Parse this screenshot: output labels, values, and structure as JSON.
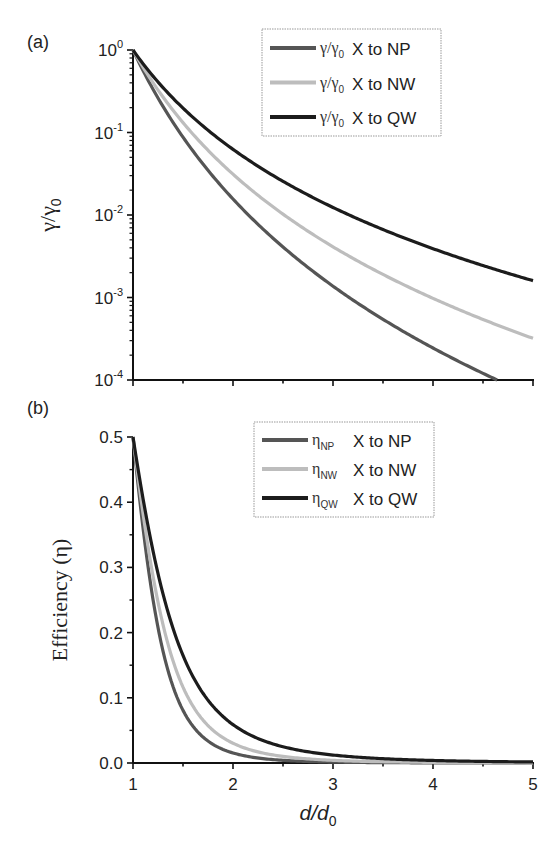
{
  "chart_data": [
    {
      "panel": "(a)",
      "type": "line",
      "title": "",
      "xlabel": "",
      "ylabel": "γ/γ0",
      "yscale": "log",
      "xlim": [
        1,
        5
      ],
      "ylim": [
        0.0001,
        1
      ],
      "y_ticks": [
        "10^0",
        "10^-1",
        "10^-2",
        "10^-3",
        "10^-4"
      ],
      "x_ticks": [],
      "grid": false,
      "legend_position": "upper right",
      "model": "γ/γ0 = (d/d0)^-n",
      "x": [
        1,
        1.25,
        1.5,
        1.75,
        2,
        2.5,
        3,
        3.5,
        4,
        4.5,
        5
      ],
      "series": [
        {
          "name": "γ/γ0 X to NP",
          "symbol": "γ/γ",
          "sub": "0",
          "label": "X to NP",
          "exponent": 6,
          "color": "#555555",
          "values": [
            1,
            0.262,
            0.0878,
            0.0349,
            0.0156,
            0.0041,
            0.00137,
            0.00054,
            0.000244,
            0.00012,
            6.4e-05
          ]
        },
        {
          "name": "γ/γ0 X to NW",
          "symbol": "γ/γ",
          "sub": "0",
          "label": "X to NW",
          "exponent": 5,
          "color": "#bdbdbd",
          "values": [
            1,
            0.328,
            0.132,
            0.0609,
            0.03125,
            0.01024,
            0.00412,
            0.0019,
            0.000977,
            0.000542,
            0.00032
          ]
        },
        {
          "name": "γ/γ0 X to QW",
          "symbol": "γ/γ",
          "sub": "0",
          "label": "X to QW",
          "exponent": 4,
          "color": "#1c1c1c",
          "values": [
            1,
            0.4096,
            0.1975,
            0.1066,
            0.0625,
            0.0256,
            0.01235,
            0.00666,
            0.0039,
            0.00244,
            0.0016
          ]
        }
      ]
    },
    {
      "panel": "(b)",
      "type": "line",
      "title": "",
      "xlabel": "d/d0",
      "ylabel": "Efficiency (η)",
      "yscale": "linear",
      "xlim": [
        1,
        5
      ],
      "ylim": [
        0,
        0.5
      ],
      "x_ticks": [
        "1",
        "2",
        "3",
        "4",
        "5"
      ],
      "y_ticks": [
        "0.0",
        "0.1",
        "0.2",
        "0.3",
        "0.4",
        "0.5"
      ],
      "grid": false,
      "legend_position": "upper right",
      "model": "η = 1 / (1 + (d/d0)^n)",
      "x": [
        1,
        1.25,
        1.5,
        1.75,
        2,
        2.5,
        3,
        3.5,
        4,
        4.5,
        5
      ],
      "series": [
        {
          "name": "ηNP X to NP",
          "symbol": "η",
          "sub": "NP",
          "label": "X to NP",
          "exponent": 6,
          "color": "#555555",
          "values": [
            0.5,
            0.208,
            0.081,
            0.034,
            0.015,
            0.004,
            0.0014,
            0.0005,
            0.0002,
            0.0001,
            0.0001
          ]
        },
        {
          "name": "ηNW X to NW",
          "symbol": "η",
          "sub": "NW",
          "label": "X to NW",
          "exponent": 5,
          "color": "#bdbdbd",
          "values": [
            0.5,
            0.247,
            0.116,
            0.057,
            0.03,
            0.01,
            0.0041,
            0.0019,
            0.001,
            0.0005,
            0.0003
          ]
        },
        {
          "name": "ηQW X to QW",
          "symbol": "η",
          "sub": "QW",
          "label": "X to QW",
          "exponent": 4,
          "color": "#1c1c1c",
          "values": [
            0.5,
            0.291,
            0.165,
            0.096,
            0.059,
            0.025,
            0.012,
            0.0066,
            0.0039,
            0.0024,
            0.0016
          ]
        }
      ]
    }
  ]
}
